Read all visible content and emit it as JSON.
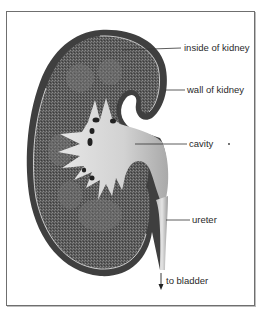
{
  "diagram": {
    "labels": [
      {
        "id": "inside",
        "text": "inside of kidney"
      },
      {
        "id": "wall",
        "text": "wall of kidney"
      },
      {
        "id": "cavity",
        "text": "cavity"
      },
      {
        "id": "ureter",
        "text": "ureter"
      },
      {
        "id": "bladder",
        "text": "to bladder"
      }
    ],
    "colors": {
      "wall": "#4a4a4a",
      "inside": "#5e5e5e",
      "cavity": "#cfcfcf",
      "frame": "#6f6f6f",
      "text": "#2a2a2a"
    }
  }
}
